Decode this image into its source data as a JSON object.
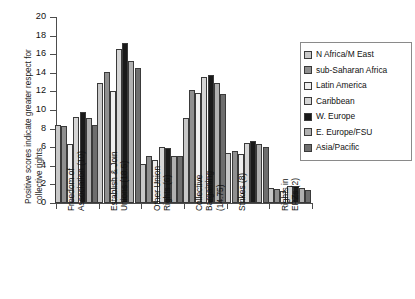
{
  "chart_data": {
    "type": "bar",
    "title": "",
    "xlabel": "",
    "ylabel": "Positive scores indicate greater respect for collective rights",
    "ylim": [
      0,
      20
    ],
    "ytick_values": [
      0,
      2,
      4,
      6,
      8,
      10,
      12,
      14,
      16,
      18,
      20
    ],
    "ytick_labels": [
      "0",
      "2",
      "4",
      "6",
      "8",
      "10",
      "12",
      "14",
      "16",
      "18",
      "20"
    ],
    "grid": false,
    "legend_position": "right",
    "categories": [
      "Freedom of\nAssociation (10)",
      "Establish & Join\nUnions (18.5)",
      "Other Union\nRights (6)",
      "Collective\nBargaining\n(14.75)",
      "Strikes (8)",
      "Rights in\nEPZs (2)"
    ],
    "series": [
      {
        "name": "N Africa/M East",
        "color": "#c8c8c8",
        "values": [
          8.4,
          12.9,
          4.2,
          9.1,
          5.4,
          1.6
        ]
      },
      {
        "name": "sub-Saharan Africa",
        "color": "#8f8f8f",
        "values": [
          8.3,
          14.1,
          5.1,
          12.2,
          5.6,
          1.5
        ]
      },
      {
        "name": "Latin America",
        "color": "#efefef",
        "values": [
          6.3,
          12.0,
          4.6,
          11.8,
          5.3,
          1.3
        ]
      },
      {
        "name": "Caribbean",
        "color": "#d6d6d6",
        "values": [
          9.2,
          16.6,
          6.0,
          13.5,
          6.5,
          1.8
        ]
      },
      {
        "name": "W. Europe",
        "color": "#1a1a1a",
        "values": [
          9.8,
          17.2,
          5.9,
          13.8,
          6.7,
          1.8
        ]
      },
      {
        "name": "E. Europe/FSU",
        "color": "#b0b0b0",
        "values": [
          9.1,
          15.3,
          5.1,
          12.9,
          6.3,
          1.6
        ]
      },
      {
        "name": "Asia/Pacific",
        "color": "#6e6e6e",
        "values": [
          8.4,
          14.5,
          5.1,
          11.7,
          6.0,
          1.4
        ]
      }
    ]
  }
}
